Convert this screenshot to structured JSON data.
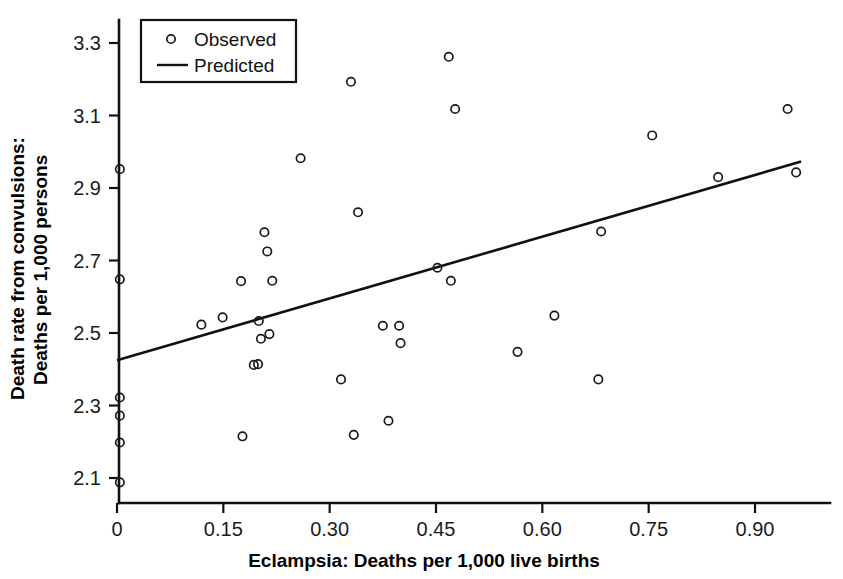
{
  "chart_data": {
    "type": "scatter",
    "title": "",
    "xlabel": "Eclampsia: Deaths per 1,000 live births",
    "ylabel_line1": "Death rate from convulsions:",
    "ylabel_line2": "Deaths per 1,000 persons",
    "xlim": [
      -0.035,
      1.0
    ],
    "ylim": [
      2.03,
      3.37
    ],
    "xticks": [
      0,
      0.15,
      0.3,
      0.45,
      0.6,
      0.75,
      0.9
    ],
    "xtick_labels": [
      "0",
      "0.15",
      "0.30",
      "0.45",
      "0.60",
      "0.75",
      "0.90"
    ],
    "yticks": [
      2.1,
      2.3,
      2.5,
      2.7,
      2.9,
      3.1,
      3.3
    ],
    "ytick_labels": [
      "2.1",
      "2.3",
      "2.5",
      "2.7",
      "2.9",
      "3.1",
      "3.3"
    ],
    "grid": false,
    "legend_position": "top-left",
    "legend": [
      {
        "label": "Observed",
        "marker": "open-circle"
      },
      {
        "label": "Predicted",
        "marker": "line"
      }
    ],
    "series": [
      {
        "name": "Observed",
        "marker": "open-circle",
        "points": [
          [
            0.004,
            2.952
          ],
          [
            0.004,
            2.648
          ],
          [
            0.004,
            2.322
          ],
          [
            0.004,
            2.272
          ],
          [
            0.004,
            2.198
          ],
          [
            0.004,
            2.088
          ],
          [
            0.119,
            2.523
          ],
          [
            0.149,
            2.543
          ],
          [
            0.175,
            2.643
          ],
          [
            0.177,
            2.215
          ],
          [
            0.193,
            2.412
          ],
          [
            0.199,
            2.414
          ],
          [
            0.2,
            2.533
          ],
          [
            0.203,
            2.484
          ],
          [
            0.208,
            2.778
          ],
          [
            0.212,
            2.725
          ],
          [
            0.215,
            2.497
          ],
          [
            0.219,
            2.644
          ],
          [
            0.259,
            2.982
          ],
          [
            0.316,
            2.372
          ],
          [
            0.33,
            3.193
          ],
          [
            0.334,
            2.219
          ],
          [
            0.34,
            2.833
          ],
          [
            0.375,
            2.52
          ],
          [
            0.383,
            2.258
          ],
          [
            0.398,
            2.52
          ],
          [
            0.4,
            2.472
          ],
          [
            0.452,
            2.68
          ],
          [
            0.468,
            3.262
          ],
          [
            0.471,
            2.644
          ],
          [
            0.477,
            3.118
          ],
          [
            0.565,
            2.448
          ],
          [
            0.617,
            2.548
          ],
          [
            0.679,
            2.372
          ],
          [
            0.683,
            2.78
          ],
          [
            0.755,
            3.045
          ],
          [
            0.848,
            2.93
          ],
          [
            0.946,
            3.118
          ],
          [
            0.958,
            2.943
          ]
        ]
      }
    ],
    "fit_line": {
      "name": "Predicted",
      "x0": 0.0,
      "y0": 2.425,
      "x1": 0.965,
      "y1": 2.973
    }
  },
  "legend": {
    "observed_label": "Observed",
    "predicted_label": "Predicted"
  },
  "axes": {
    "x_title": "Eclampsia: Deaths per 1,000 live births",
    "y_title_line1": "Death rate from convulsions:",
    "y_title_line2": "Deaths per 1,000 persons"
  }
}
